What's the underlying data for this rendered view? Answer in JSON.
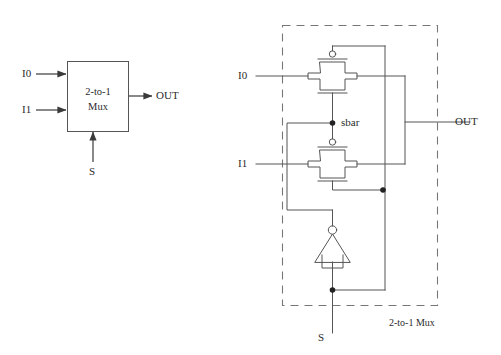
{
  "figure": {
    "stroke_color": "#555555",
    "text_color": "#2b2b2b",
    "background": "#ffffff"
  },
  "symbol_view": {
    "block_label_line1": "2-to-1",
    "block_label_line2": "Mux",
    "inputs": [
      {
        "name": "I0",
        "label": "I0"
      },
      {
        "name": "I1",
        "label": "I1"
      }
    ],
    "select": {
      "name": "S",
      "label": "S"
    },
    "output": {
      "name": "OUT",
      "label": "OUT"
    }
  },
  "transistor_view": {
    "inputs": [
      {
        "name": "I0",
        "label": "I0"
      },
      {
        "name": "I1",
        "label": "I1"
      }
    ],
    "select": {
      "name": "S",
      "label": "S"
    },
    "output": {
      "name": "OUT",
      "label": "OUT"
    },
    "internal_node": {
      "name": "sbar",
      "label": "sbar"
    },
    "boundary_label": "2-to-1 Mux",
    "gates": [
      {
        "name": "transmission-gate-i0",
        "type": "transmission-gate",
        "controls": "sbar"
      },
      {
        "name": "transmission-gate-i1",
        "type": "transmission-gate",
        "controls": "sbar"
      },
      {
        "name": "inverter-s",
        "type": "inverter",
        "input": "S",
        "output": "sbar"
      }
    ]
  }
}
